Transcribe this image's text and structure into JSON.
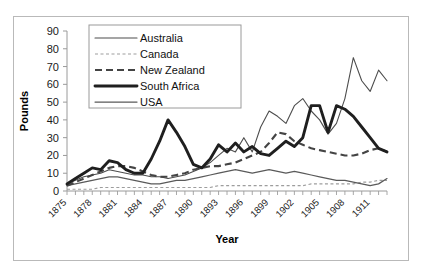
{
  "chart_data": {
    "type": "line",
    "title": "",
    "xlabel": "Year",
    "ylabel": "Pounds",
    "xlim": [
      1875,
      1913
    ],
    "ylim": [
      0,
      90
    ],
    "yticks": [
      0,
      10,
      20,
      30,
      40,
      50,
      60,
      70,
      80,
      90
    ],
    "xticks": [
      1875,
      1878,
      1881,
      1884,
      1887,
      1890,
      1893,
      1896,
      1899,
      1902,
      1905,
      1908,
      1911
    ],
    "xtick_labels": [
      "1875",
      "1878",
      "1881",
      "1884",
      "1887",
      "1890",
      "1893",
      "1896",
      "1899",
      "1902",
      "1905",
      "1908",
      "1911"
    ],
    "xtick_rotation": 45,
    "grid": false,
    "legend_position": "top-left",
    "x": [
      1875,
      1876,
      1877,
      1878,
      1879,
      1880,
      1881,
      1882,
      1883,
      1884,
      1885,
      1886,
      1887,
      1888,
      1889,
      1890,
      1891,
      1892,
      1893,
      1894,
      1895,
      1896,
      1897,
      1898,
      1899,
      1900,
      1901,
      1902,
      1903,
      1904,
      1905,
      1906,
      1907,
      1908,
      1909,
      1910,
      1911,
      1912,
      1913
    ],
    "series": [
      {
        "name": "Australia",
        "style": "thin-solid",
        "color": "#4d4d4d",
        "values": [
          4,
          6,
          8,
          9,
          10,
          12,
          11,
          10,
          9,
          9,
          8,
          8,
          7,
          8,
          9,
          11,
          13,
          16,
          20,
          24,
          22,
          30,
          22,
          36,
          45,
          42,
          38,
          48,
          52,
          45,
          40,
          32,
          38,
          52,
          75,
          62,
          56,
          68,
          62
        ]
      },
      {
        "name": "Canada",
        "style": "dotted",
        "color": "#9d9d9d",
        "values": [
          1,
          1,
          1,
          1,
          2,
          2,
          2,
          2,
          2,
          2,
          2,
          2,
          2,
          2,
          2,
          2,
          2,
          2,
          3,
          3,
          3,
          3,
          3,
          3,
          3,
          3,
          3,
          3,
          3,
          4,
          4,
          4,
          4,
          4,
          4,
          5,
          5,
          6,
          6
        ]
      },
      {
        "name": "New Zealand",
        "style": "dashed",
        "color": "#444444",
        "values": [
          3,
          5,
          7,
          9,
          11,
          13,
          14,
          14,
          13,
          11,
          9,
          8,
          8,
          9,
          10,
          12,
          13,
          14,
          14,
          15,
          16,
          18,
          20,
          22,
          27,
          33,
          32,
          28,
          26,
          24,
          23,
          22,
          21,
          20,
          20,
          21,
          23,
          24,
          22
        ]
      },
      {
        "name": "South Africa",
        "style": "thick-solid",
        "color": "#1f1f1f",
        "values": [
          4,
          7,
          10,
          13,
          12,
          17,
          16,
          12,
          10,
          10,
          18,
          28,
          40,
          33,
          25,
          15,
          13,
          18,
          26,
          22,
          27,
          22,
          25,
          21,
          20,
          24,
          28,
          25,
          30,
          48,
          48,
          33,
          48,
          46,
          42,
          36,
          30,
          24,
          22
        ]
      },
      {
        "name": "USA",
        "style": "medium-solid",
        "color": "#5a5a5a",
        "values": [
          3,
          4,
          5,
          6,
          7,
          8,
          8,
          7,
          6,
          5,
          4,
          4,
          5,
          6,
          6,
          7,
          8,
          9,
          10,
          11,
          12,
          11,
          10,
          11,
          12,
          11,
          10,
          11,
          10,
          9,
          8,
          7,
          6,
          6,
          5,
          4,
          3,
          4,
          7
        ]
      }
    ]
  },
  "legend": {
    "items": [
      {
        "label": "Australia"
      },
      {
        "label": "Canada"
      },
      {
        "label": "New Zealand"
      },
      {
        "label": "South Africa"
      },
      {
        "label": "USA"
      }
    ]
  },
  "axes": {
    "y_title": "Pounds",
    "x_title": "Year"
  }
}
